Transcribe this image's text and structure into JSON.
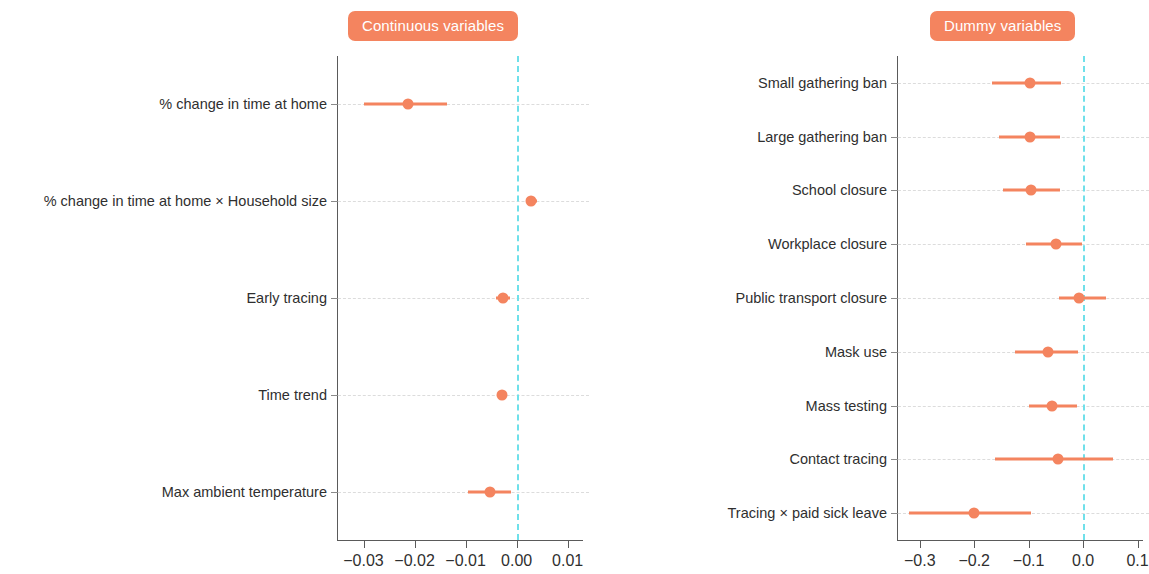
{
  "colors": {
    "accent": "#f4845f",
    "zero_line": "#6fe0ea",
    "axis": "#5a5a5a",
    "grid": "#dcdcdc",
    "text": "#2f2f2f"
  },
  "panels": {
    "continuous": {
      "title": "Continuous variables"
    },
    "dummy": {
      "title": "Dummy variables"
    }
  },
  "chart_data": [
    {
      "type": "scatter",
      "title": "Continuous variables",
      "xlabel": "",
      "ylabel": "",
      "xlim": [
        -0.035,
        0.013
      ],
      "grid": true,
      "legend": null,
      "zero_reference": 0.0,
      "xticks": [
        -0.03,
        -0.02,
        -0.01,
        0.0,
        0.01
      ],
      "xticklabels": [
        "−0.03",
        "−0.02",
        "−0.01",
        "0.00",
        "0.01"
      ],
      "categories": [
        "% change in time at home",
        "% change in time at home × Household size",
        "Early tracing",
        "Time trend",
        "Max ambient temperature"
      ],
      "values": [
        -0.0212,
        0.0028,
        -0.0026,
        -0.0028,
        -0.0052
      ],
      "ci_low": [
        -0.03,
        0.0019,
        -0.004,
        -0.0039,
        -0.0095
      ],
      "ci_high": [
        -0.0137,
        0.0039,
        -0.0013,
        -0.0018,
        -0.0011
      ]
    },
    {
      "type": "scatter",
      "title": "Dummy variables",
      "xlabel": "",
      "ylabel": "",
      "xlim": [
        -0.34,
        0.11
      ],
      "grid": true,
      "legend": null,
      "zero_reference": 0.0,
      "xticks": [
        -0.3,
        -0.2,
        -0.1,
        0.0,
        0.1
      ],
      "xticklabels": [
        "−0.3",
        "−0.2",
        "−0.1",
        "0.0",
        "0.1"
      ],
      "categories": [
        "Small gathering ban",
        "Large gathering ban",
        "School closure",
        "Workplace closure",
        "Public transport closure",
        "Mask use",
        "Mass testing",
        "Contact tracing",
        "Tracing × paid sick leave"
      ],
      "values": [
        -0.098,
        -0.098,
        -0.095,
        -0.05,
        -0.008,
        -0.065,
        -0.057,
        -0.047,
        -0.2
      ],
      "ci_low": [
        -0.168,
        -0.155,
        -0.147,
        -0.105,
        -0.045,
        -0.125,
        -0.1,
        -0.162,
        -0.32
      ],
      "ci_high": [
        -0.04,
        -0.042,
        -0.043,
        -0.002,
        0.042,
        -0.01,
        -0.012,
        0.055,
        -0.095
      ]
    }
  ]
}
